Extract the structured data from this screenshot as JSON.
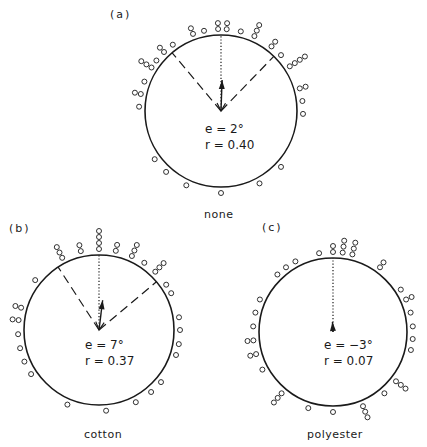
{
  "chart_data": [
    {
      "id": "a",
      "type": "scatter",
      "subtype": "circular",
      "panel_label": "(a)",
      "caption": "none",
      "stats": {
        "e": "e = 2°",
        "r": "r = 0.40"
      },
      "mean_angle_deg": 2,
      "mean_vector_length": 0.4,
      "reference_direction_deg": 0,
      "confidence_interval_deg": [
        -40,
        44
      ],
      "points": [
        {
          "angle": -2,
          "stack": 1
        },
        {
          "angle": -2,
          "stack": 2
        },
        {
          "angle": 4,
          "stack": 1
        },
        {
          "angle": 4,
          "stack": 2
        },
        {
          "angle": -12,
          "stack": 1
        },
        {
          "angle": -20,
          "stack": 1
        },
        {
          "angle": -20,
          "stack": 2
        },
        {
          "angle": 14,
          "stack": 1
        },
        {
          "angle": 24,
          "stack": 1
        },
        {
          "angle": 24,
          "stack": 2
        },
        {
          "angle": 24,
          "stack": 3
        },
        {
          "angle": -36,
          "stack": 1
        },
        {
          "angle": -44,
          "stack": 1
        },
        {
          "angle": -44,
          "stack": 2
        },
        {
          "angle": 38,
          "stack": 1
        },
        {
          "angle": 38,
          "stack": 2
        },
        {
          "angle": 47,
          "stack": 1
        },
        {
          "angle": -52,
          "stack": 1
        },
        {
          "angle": -58,
          "stack": 1
        },
        {
          "angle": -58,
          "stack": 2
        },
        {
          "angle": -58,
          "stack": 3
        },
        {
          "angle": 57,
          "stack": 1
        },
        {
          "angle": 57,
          "stack": 2
        },
        {
          "angle": 57,
          "stack": 3
        },
        {
          "angle": 57,
          "stack": 4
        },
        {
          "angle": -69,
          "stack": 1
        },
        {
          "angle": -78,
          "stack": 1
        },
        {
          "angle": -78,
          "stack": 2
        },
        {
          "angle": -87,
          "stack": 1
        },
        {
          "angle": 74,
          "stack": 1
        },
        {
          "angle": 74,
          "stack": 2
        },
        {
          "angle": 83,
          "stack": 1
        },
        {
          "angle": 92,
          "stack": 1
        },
        {
          "angle": -126,
          "stack": 1
        },
        {
          "angle": -138,
          "stack": 1
        },
        {
          "angle": -155,
          "stack": 1
        },
        {
          "angle": 180,
          "stack": 1
        },
        {
          "angle": 152,
          "stack": 1
        },
        {
          "angle": 133,
          "stack": 1
        }
      ]
    },
    {
      "id": "b",
      "type": "scatter",
      "subtype": "circular",
      "panel_label": "(b)",
      "caption": "cotton",
      "stats": {
        "e": "e = 7°",
        "r": "r = 0.37"
      },
      "mean_angle_deg": 7,
      "mean_vector_length": 0.37,
      "reference_direction_deg": 0,
      "confidence_interval_deg": [
        -33,
        50
      ],
      "points": [
        {
          "angle": 0,
          "stack": 1
        },
        {
          "angle": 0,
          "stack": 2
        },
        {
          "angle": 0,
          "stack": 3
        },
        {
          "angle": 0,
          "stack": 4
        },
        {
          "angle": -13,
          "stack": 1
        },
        {
          "angle": -13,
          "stack": 2
        },
        {
          "angle": -27,
          "stack": 1
        },
        {
          "angle": -27,
          "stack": 2
        },
        {
          "angle": -27,
          "stack": 3
        },
        {
          "angle": 12,
          "stack": 1
        },
        {
          "angle": 12,
          "stack": 2
        },
        {
          "angle": 24,
          "stack": 1
        },
        {
          "angle": 24,
          "stack": 2
        },
        {
          "angle": 24,
          "stack": 3
        },
        {
          "angle": 34,
          "stack": 1
        },
        {
          "angle": 44,
          "stack": 1
        },
        {
          "angle": 44,
          "stack": 2
        },
        {
          "angle": 44,
          "stack": 3
        },
        {
          "angle": 56,
          "stack": 1
        },
        {
          "angle": 63,
          "stack": 1
        },
        {
          "angle": -52,
          "stack": 1
        },
        {
          "angle": -74,
          "stack": 1
        },
        {
          "angle": -74,
          "stack": 2
        },
        {
          "angle": -83,
          "stack": 1
        },
        {
          "angle": -83,
          "stack": 2
        },
        {
          "angle": -93,
          "stack": 1
        },
        {
          "angle": -103,
          "stack": 1
        },
        {
          "angle": -113,
          "stack": 1
        },
        {
          "angle": -123,
          "stack": 1
        },
        {
          "angle": 81,
          "stack": 1
        },
        {
          "angle": 90,
          "stack": 1
        },
        {
          "angle": 100,
          "stack": 1
        },
        {
          "angle": 108,
          "stack": 1
        },
        {
          "angle": 130,
          "stack": 1
        },
        {
          "angle": 140,
          "stack": 1
        },
        {
          "angle": 153,
          "stack": 1
        },
        {
          "angle": -157,
          "stack": 1
        },
        {
          "angle": 175,
          "stack": 1
        }
      ]
    },
    {
      "id": "c",
      "type": "scatter",
      "subtype": "circular",
      "panel_label": "(c)",
      "caption": "polyester",
      "stats": {
        "e": "e = −3°",
        "r": "r = 0.07"
      },
      "mean_angle_deg": -3,
      "mean_vector_length": 0.07,
      "reference_direction_deg": 0,
      "confidence_interval_deg": null,
      "points": [
        {
          "angle": 0,
          "stack": 1
        },
        {
          "angle": 0,
          "stack": 2
        },
        {
          "angle": 7,
          "stack": 1
        },
        {
          "angle": 7,
          "stack": 2
        },
        {
          "angle": 7,
          "stack": 3
        },
        {
          "angle": 14,
          "stack": 1
        },
        {
          "angle": 14,
          "stack": 2
        },
        {
          "angle": 14,
          "stack": 3
        },
        {
          "angle": -10,
          "stack": 1
        },
        {
          "angle": 36,
          "stack": 1
        },
        {
          "angle": 36,
          "stack": 2
        },
        {
          "angle": -28,
          "stack": 1
        },
        {
          "angle": -36,
          "stack": 1
        },
        {
          "angle": -44,
          "stack": 1
        },
        {
          "angle": 58,
          "stack": 1
        },
        {
          "angle": 66,
          "stack": 1
        },
        {
          "angle": 66,
          "stack": 2
        },
        {
          "angle": 76,
          "stack": 1
        },
        {
          "angle": 86,
          "stack": 1
        },
        {
          "angle": 95,
          "stack": 1
        },
        {
          "angle": 103,
          "stack": 1
        },
        {
          "angle": -66,
          "stack": 1
        },
        {
          "angle": -76,
          "stack": 1
        },
        {
          "angle": -86,
          "stack": 1
        },
        {
          "angle": -96,
          "stack": 1
        },
        {
          "angle": -96,
          "stack": 2
        },
        {
          "angle": -106,
          "stack": 1
        },
        {
          "angle": -106,
          "stack": 2
        },
        {
          "angle": -118,
          "stack": 1
        },
        {
          "angle": -140,
          "stack": 1
        },
        {
          "angle": -140,
          "stack": 2
        },
        {
          "angle": -140,
          "stack": 3
        },
        {
          "angle": -162,
          "stack": 1
        },
        {
          "angle": 180,
          "stack": 1
        },
        {
          "angle": 158,
          "stack": 1
        },
        {
          "angle": 158,
          "stack": 2
        },
        {
          "angle": 158,
          "stack": 3
        },
        {
          "angle": 140,
          "stack": 1
        },
        {
          "angle": 128,
          "stack": 1
        },
        {
          "angle": 128,
          "stack": 2
        },
        {
          "angle": 128,
          "stack": 3
        }
      ]
    }
  ],
  "layout": {
    "panels": [
      {
        "cx": 221,
        "cy": 111,
        "r": 76,
        "arrow_len": 31,
        "label_pos": [
          110,
          8
        ],
        "caption_pos": [
          204,
          208
        ],
        "stats_pos": [
          205,
          121
        ]
      },
      {
        "cx": 99,
        "cy": 330,
        "r": 75,
        "arrow_len": 30,
        "label_pos": [
          9,
          222
        ],
        "caption_pos": [
          84,
          428
        ],
        "stats_pos": [
          85,
          337
        ]
      },
      {
        "cx": 333,
        "cy": 332,
        "r": 74,
        "arrow_len": 10,
        "label_pos": [
          262,
          221
        ],
        "caption_pos": [
          307,
          428
        ],
        "stats_pos": [
          324,
          337
        ]
      }
    ],
    "colors": {
      "ink": "#1a1a1a",
      "background": "#ffffff"
    }
  }
}
